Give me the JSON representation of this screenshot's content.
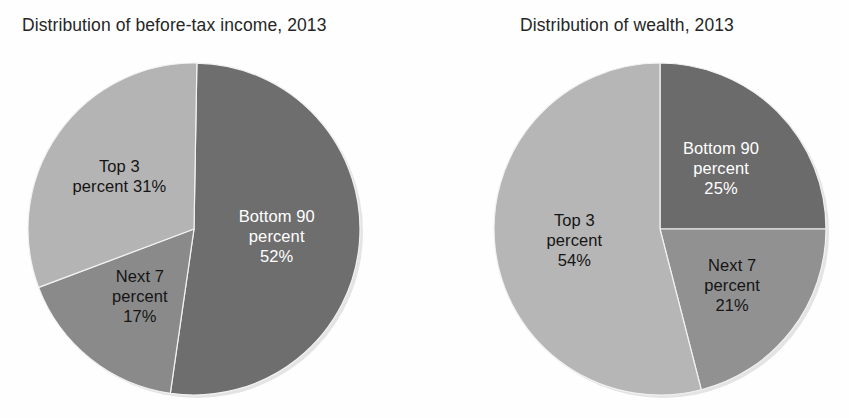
{
  "chart_data": [
    {
      "type": "pie",
      "id": "income",
      "title": "Distribution of before-tax income, 2013",
      "categories": [
        "Bottom 90 percent",
        "Next 7 percent",
        "Top 3 percent"
      ],
      "values": [
        52,
        17,
        31
      ],
      "value_labels": [
        "52%",
        "17%",
        "31%"
      ],
      "unit": "percent",
      "legend": "none",
      "grid": false,
      "start_angle_deg": 1,
      "direction": "clockwise",
      "slices": [
        {
          "name": "Bottom 90 percent",
          "value": 52,
          "label_lines": [
            "Bottom 90",
            "percent",
            "52%"
          ],
          "color": "#6e6e6e",
          "text_color": "#ffffff"
        },
        {
          "name": "Next 7 percent",
          "value": 17,
          "label_lines": [
            "Next 7",
            "percent",
            "17%"
          ],
          "color": "#8a8a8a",
          "text_color": "#151515"
        },
        {
          "name": "Top 3 percent",
          "value": 31,
          "label_lines": [
            "Top 3",
            "percent 31%"
          ],
          "color": "#b4b4b4",
          "text_color": "#151515"
        }
      ]
    },
    {
      "type": "pie",
      "id": "wealth",
      "title": "Distribution of wealth, 2013",
      "categories": [
        "Bottom 90 percent",
        "Next 7 percent",
        "Top 3 percent"
      ],
      "values": [
        25,
        21,
        54
      ],
      "value_labels": [
        "25%",
        "21%",
        "54%"
      ],
      "unit": "percent",
      "legend": "none",
      "grid": false,
      "start_angle_deg": 0,
      "direction": "clockwise",
      "slices": [
        {
          "name": "Bottom 90 percent",
          "value": 25,
          "label_lines": [
            "Bottom 90",
            "percent",
            "25%"
          ],
          "color": "#6b6b6b",
          "text_color": "#ffffff"
        },
        {
          "name": "Next 7 percent",
          "value": 21,
          "label_lines": [
            "Next 7",
            "percent",
            "21%"
          ],
          "color": "#919191",
          "text_color": "#151515"
        },
        {
          "name": "Top 3 percent",
          "value": 54,
          "label_lines": [
            "Top 3",
            "percent",
            "54%"
          ],
          "color": "#b6b6b6",
          "text_color": "#151515"
        }
      ]
    }
  ],
  "figure": {
    "background": "#fefefe",
    "panels": [
      {
        "id": "income",
        "title": "Distribution of before-tax income, 2013"
      },
      {
        "id": "wealth",
        "title": "Distribution of wealth, 2013"
      }
    ]
  }
}
